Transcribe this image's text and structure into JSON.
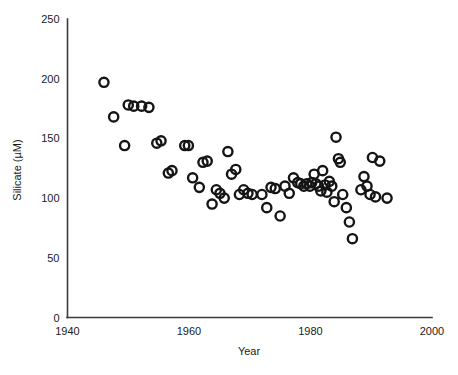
{
  "chart_data": {
    "type": "scatter",
    "title": "",
    "xlabel": "Year",
    "ylabel": "Silicate (µM)",
    "xlim": [
      1940,
      2000
    ],
    "ylim": [
      0,
      250
    ],
    "xticks": [
      1940,
      1960,
      1980,
      2000
    ],
    "yticks": [
      0,
      50,
      100,
      150,
      200,
      250
    ],
    "xtick_labels": [
      "1940",
      "1960",
      "1980",
      "2000"
    ],
    "ytick_labels": [
      "0",
      "50",
      "100",
      "150",
      "200",
      "250"
    ],
    "grid": false,
    "legend": false,
    "marker": "open-circle",
    "marker_color": "#151515",
    "marker_radius_px": 4.6,
    "marker_stroke_px": 2.4,
    "series": [
      {
        "name": "Silicate",
        "points": [
          [
            1946.0,
            197
          ],
          [
            1947.6,
            168
          ],
          [
            1949.4,
            144
          ],
          [
            1950.0,
            178
          ],
          [
            1950.9,
            177
          ],
          [
            1952.2,
            177
          ],
          [
            1953.4,
            176
          ],
          [
            1954.7,
            146
          ],
          [
            1955.4,
            148
          ],
          [
            1956.6,
            121
          ],
          [
            1957.2,
            123
          ],
          [
            1959.3,
            144
          ],
          [
            1959.9,
            144
          ],
          [
            1960.6,
            117
          ],
          [
            1961.7,
            109
          ],
          [
            1962.3,
            130
          ],
          [
            1963.0,
            131
          ],
          [
            1963.8,
            95
          ],
          [
            1964.5,
            107
          ],
          [
            1965.1,
            104
          ],
          [
            1965.8,
            100
          ],
          [
            1966.4,
            139
          ],
          [
            1967.0,
            120
          ],
          [
            1967.7,
            124
          ],
          [
            1968.3,
            103
          ],
          [
            1969.0,
            107
          ],
          [
            1969.7,
            104
          ],
          [
            1970.4,
            103
          ],
          [
            1972.0,
            103
          ],
          [
            1972.8,
            92
          ],
          [
            1973.5,
            109
          ],
          [
            1974.2,
            108
          ],
          [
            1975.0,
            85
          ],
          [
            1975.8,
            110
          ],
          [
            1976.5,
            104
          ],
          [
            1977.2,
            117
          ],
          [
            1977.9,
            113
          ],
          [
            1978.4,
            112
          ],
          [
            1978.9,
            110
          ],
          [
            1979.4,
            112
          ],
          [
            1979.9,
            110
          ],
          [
            1980.2,
            113
          ],
          [
            1980.6,
            120
          ],
          [
            1980.9,
            112
          ],
          [
            1981.3,
            110
          ],
          [
            1981.7,
            106
          ],
          [
            1982.0,
            123
          ],
          [
            1982.4,
            111
          ],
          [
            1982.7,
            105
          ],
          [
            1983.1,
            114
          ],
          [
            1983.5,
            110
          ],
          [
            1983.9,
            97
          ],
          [
            1984.2,
            151
          ],
          [
            1984.6,
            133
          ],
          [
            1984.9,
            130
          ],
          [
            1985.3,
            103
          ],
          [
            1985.9,
            92
          ],
          [
            1986.4,
            80
          ],
          [
            1986.9,
            66
          ],
          [
            1988.3,
            107
          ],
          [
            1988.8,
            118
          ],
          [
            1989.3,
            110
          ],
          [
            1989.8,
            103
          ],
          [
            1990.2,
            134
          ],
          [
            1990.7,
            101
          ],
          [
            1991.4,
            131
          ],
          [
            1992.6,
            100
          ]
        ]
      }
    ]
  },
  "axes": {
    "x_axis_name": "year-axis",
    "y_axis_name": "silicate-axis"
  }
}
